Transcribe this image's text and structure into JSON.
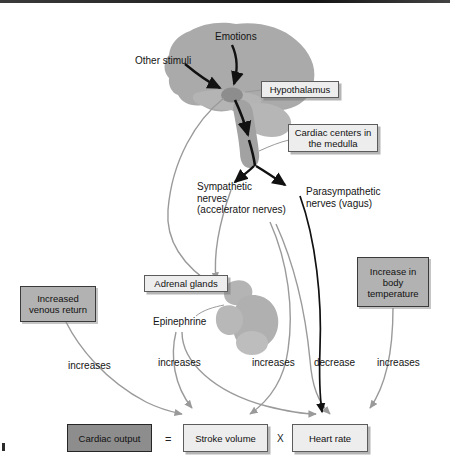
{
  "figure": {
    "type": "physiology-flow-diagram"
  },
  "anatomy": {
    "brain_label": "brain",
    "hypothalamus_label": "hypothalamus-structure",
    "medulla_label": "medulla-structure",
    "kidney_label": "kidney-with-adrenal-gland"
  },
  "stimuli": [
    {
      "id": "emotions",
      "text": "Emotions"
    },
    {
      "id": "other-stimuli",
      "text": "Other stimuli"
    }
  ],
  "callouts": [
    {
      "id": "hypothalamus",
      "text": "Hypothalamus"
    },
    {
      "id": "cardiac-centers",
      "text": "Cardiac centers in\nthe medulla"
    },
    {
      "id": "adrenal-glands",
      "text": "Adrenal glands"
    }
  ],
  "nerve_labels": [
    {
      "id": "sympathetic",
      "text": "Sympathetic\nnerves\n(accelerator nerves)"
    },
    {
      "id": "parasympathetic",
      "text": "Parasympathetic\nnerves (vagus)"
    }
  ],
  "hormone": {
    "id": "epinephrine",
    "text": "Epinephrine"
  },
  "factor_boxes": [
    {
      "id": "venous-return",
      "text": "Increased\nvenous return"
    },
    {
      "id": "body-temperature",
      "text": "Increase in\nbody\ntemperature"
    }
  ],
  "effect_labels": [
    {
      "id": "venous-return-effect",
      "text": "increases"
    },
    {
      "id": "epinephrine-effect",
      "text": "increases"
    },
    {
      "id": "sympathetic-effect",
      "text": "increases"
    },
    {
      "id": "vagus-effect",
      "text": "decrease"
    },
    {
      "id": "temperature-effect",
      "text": "increases"
    }
  ],
  "equation": {
    "cardiac_output": "Cardiac output",
    "equals": "=",
    "stroke_volume": "Stroke volume",
    "times": "X",
    "heart_rate": "Heart rate"
  },
  "colors": {
    "tissue": "#aaaaaa",
    "tissue_dark": "#8d8d8d",
    "gray_box": "#b2b2b2",
    "dark_box": "#8d8d8d",
    "light_box": "#ededed",
    "gray_arrow": "#9a9a9a",
    "black_arrow": "#111111"
  }
}
